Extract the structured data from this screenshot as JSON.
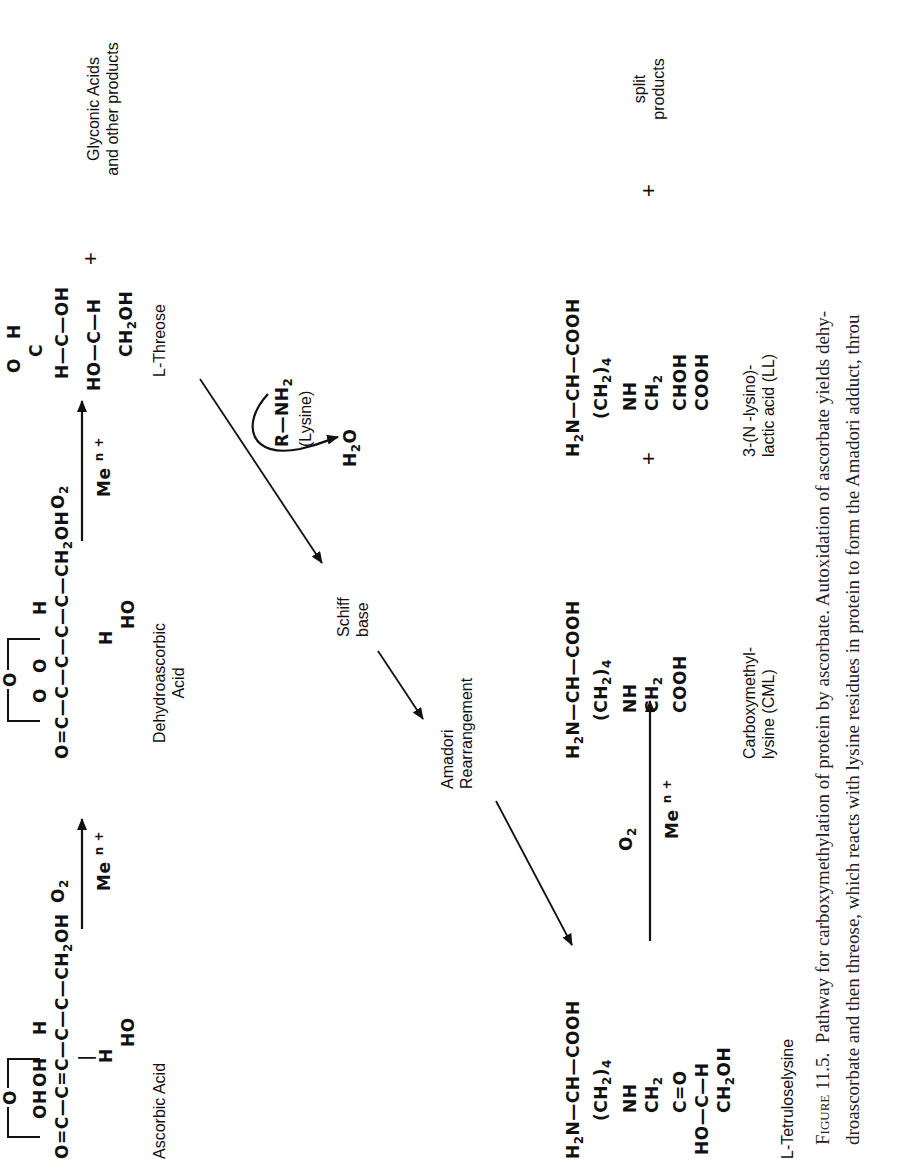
{
  "figure": {
    "caption": {
      "figure_label": "Figure 11.5.",
      "line1": "Pathway for carboxymethylation of protein by ascorbate. Autoxidation of ascorbate yields dehy-",
      "line2": "droascorbate and then threose, which reacts with lysine residues in protein to form the Amadori adduct, throu"
    },
    "reagents": {
      "o2": "O",
      "o2_sub": "2",
      "metal": "Me",
      "metal_sup": "n +"
    },
    "compounds": {
      "ascorbic_acid": {
        "name": "Ascorbic Acid",
        "ring_o": "O",
        "row_main": [
          "O=C",
          "C",
          "C",
          "C",
          "C",
          "CH₂OH"
        ],
        "substituents_top": [
          "OH",
          "OH",
          "",
          "H"
        ],
        "substituents_bottom": [
          "H",
          "HO"
        ]
      },
      "dehydroascorbic_acid": {
        "name_line1": "Dehydroascorbic",
        "name_line2": "Acid",
        "ring_o": "O",
        "substituents_top": [
          "O",
          "O",
          "H"
        ],
        "substituents_bottom": [
          "H",
          "HO"
        ]
      },
      "l_threose": {
        "name": "L-Threose",
        "aldehyde_h": "H",
        "aldehyde_o": "O"
      },
      "glyconic_acids": {
        "line1": "Glyconic Acids",
        "line2": "and other products"
      },
      "lysine": {
        "formula": "R—NH",
        "formula_sub": "2",
        "name": "(Lysine)"
      },
      "water": {
        "h": "H",
        "sub": "2",
        "o": "O"
      },
      "schiff_base": {
        "line1": "Schiff",
        "line2": "base"
      },
      "amadori": {
        "line1": "Amadori",
        "line2": "Rearrangement"
      },
      "l_tetruloselysine": {
        "name": "L-Tetruloselysine"
      },
      "cml": {
        "line1": "Carboxymethyl-",
        "line2": "lysine (CML)"
      },
      "ll": {
        "line1": "3-(N -lysino)-",
        "line2": "lactic acid (LL)"
      },
      "split_products": {
        "line1": "split",
        "line2": "products"
      }
    },
    "plus_sign": "+"
  }
}
